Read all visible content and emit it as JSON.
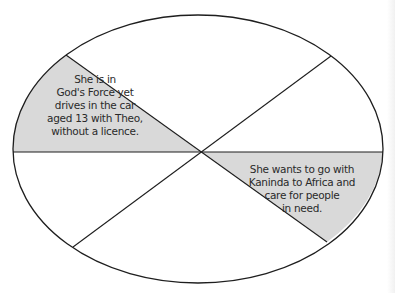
{
  "diagram": {
    "type": "divided-ellipse",
    "sector_count": 6,
    "colors": {
      "outline": "#1e1e1e",
      "shaded_fill": "#d9d9d9",
      "background": "#ffffff",
      "text": "#2a2a2a"
    },
    "sectors": [
      {
        "position": "upper-left",
        "shaded": true,
        "text": "She is in\nGod's Force yet\ndrives in the car\naged 13 with Theo,\nwithout a licence."
      },
      {
        "position": "top",
        "shaded": false,
        "text": ""
      },
      {
        "position": "upper-right",
        "shaded": false,
        "text": ""
      },
      {
        "position": "lower-right",
        "shaded": true,
        "text": "She wants to go with\nKaninda to Africa and\ncare for people\nin need."
      },
      {
        "position": "bottom",
        "shaded": false,
        "text": ""
      },
      {
        "position": "lower-left",
        "shaded": false,
        "text": ""
      }
    ]
  }
}
